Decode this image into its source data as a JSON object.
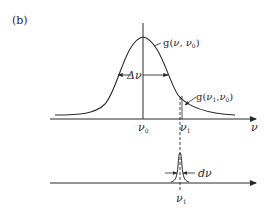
{
  "figure": {
    "panel_label": "(b)",
    "upper_plot": {
      "curve_label": "g(ν, ν₀)",
      "curve_label_parts": {
        "func": "g(",
        "arg1": "ν",
        "sep": ", ",
        "arg2": "ν",
        "arg2_sub": "0",
        "close": ")"
      },
      "width_label": "Δν",
      "point_label_parts": {
        "func": "g(",
        "arg1": "ν",
        "arg1_sub": "1",
        "sep": ",",
        "arg2": "ν",
        "arg2_sub": "0",
        "close": ")"
      },
      "x_tick_center": {
        "sym": "ν",
        "sub": "0"
      },
      "x_tick_offset": {
        "sym": "ν",
        "sub": "1"
      },
      "x_axis_label": "ν"
    },
    "lower_plot": {
      "width_label": "dν",
      "x_tick": {
        "sym": "ν",
        "sub": "1"
      }
    },
    "colors": {
      "ink": "#2a2a2a",
      "background": "#ffffff"
    }
  }
}
